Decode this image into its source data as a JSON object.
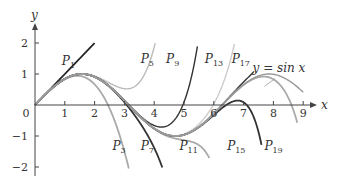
{
  "chart_data": {
    "type": "line",
    "title": "",
    "xlabel": "x",
    "ylabel": "y",
    "xlim": [
      0,
      9.3
    ],
    "ylim": [
      -2.3,
      2.5
    ],
    "grid": false,
    "x_ticks": [
      0,
      1,
      2,
      3,
      4,
      5,
      6,
      7,
      8,
      9
    ],
    "y_ticks": [
      -2,
      -1,
      1,
      2
    ],
    "x_tick_labels": [
      "0",
      "1",
      "2",
      "3",
      "4",
      "5",
      "6",
      "7",
      "8",
      "9"
    ],
    "y_tick_labels": [
      "−2",
      "−1",
      "1",
      "2"
    ],
    "series": [
      {
        "name": "P1",
        "label": "P",
        "sub": "1",
        "degree": 1,
        "color": "#222222",
        "xmax": 2.0,
        "label_pos": [
          0.9,
          1.3
        ]
      },
      {
        "name": "P3",
        "label": "P",
        "sub": "3",
        "degree": 3,
        "color": "#aaaaaa",
        "xmax": 3.2,
        "label_pos": [
          2.6,
          -1.45
        ]
      },
      {
        "name": "P5",
        "label": "P",
        "sub": "5",
        "degree": 5,
        "color": "#bbbbbb",
        "xmax": 4.4,
        "label_pos": [
          3.55,
          1.35
        ]
      },
      {
        "name": "P7",
        "label": "P",
        "sub": "7",
        "degree": 7,
        "color": "#333333",
        "xmax": 4.3,
        "label_pos": [
          3.55,
          -1.45
        ]
      },
      {
        "name": "P9",
        "label": "P",
        "sub": "9",
        "degree": 9,
        "color": "#333333",
        "xmax": 5.45,
        "label_pos": [
          4.4,
          1.35
        ]
      },
      {
        "name": "P11",
        "label": "P",
        "sub": "11",
        "degree": 11,
        "color": "#aaaaaa",
        "xmax": 5.85,
        "label_pos": [
          4.85,
          -1.45
        ]
      },
      {
        "name": "P13",
        "label": "P",
        "sub": "13",
        "degree": 13,
        "color": "#cccccc",
        "xmax": 6.85,
        "label_pos": [
          5.7,
          1.35
        ]
      },
      {
        "name": "P15",
        "label": "P",
        "sub": "15",
        "degree": 15,
        "color": "#333333",
        "xmax": 7.6,
        "label_pos": [
          6.45,
          -1.45
        ]
      },
      {
        "name": "P17",
        "label": "P",
        "sub": "17",
        "degree": 17,
        "color": "#333333",
        "xmax": 7.35,
        "label_pos": [
          6.6,
          1.35
        ]
      },
      {
        "name": "P19",
        "label": "P",
        "sub": "19",
        "degree": 19,
        "color": "#aaaaaa",
        "xmax": 8.8,
        "label_pos": [
          7.7,
          -1.45
        ]
      },
      {
        "name": "sin x",
        "label": "y = sin x",
        "sub": "",
        "degree": 0,
        "color": "#999999",
        "xmax": 9.0,
        "label_pos": [
          7.3,
          1.05
        ]
      }
    ]
  },
  "axes": {
    "x_label": "x",
    "y_label": "y"
  }
}
